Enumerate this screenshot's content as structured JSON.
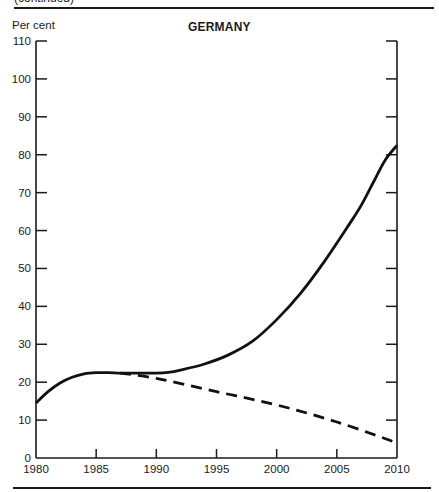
{
  "header": {
    "continued_label": "(continued)"
  },
  "chart_data": {
    "type": "line",
    "title": "GERMANY",
    "xlabel": "",
    "ylabel": "Per cent",
    "xlim": [
      1980,
      2010
    ],
    "ylim": [
      0,
      110
    ],
    "x_ticks": [
      1980,
      1985,
      1990,
      1995,
      2000,
      2005,
      2010
    ],
    "y_ticks": [
      0,
      10,
      20,
      30,
      40,
      50,
      60,
      70,
      80,
      90,
      100,
      110
    ],
    "grid": false,
    "legend": null,
    "series": [
      {
        "name": "solid line",
        "style": "solid",
        "x": [
          1980,
          1981,
          1982,
          1983,
          1984,
          1985,
          1986,
          1987,
          1988,
          1990,
          1991,
          1992,
          1994,
          1996,
          1998,
          2000,
          2002,
          2004,
          2006,
          2007,
          2008,
          2009,
          2010
        ],
        "y": [
          14.5,
          17.5,
          19.8,
          21.3,
          22.2,
          22.5,
          22.5,
          22.4,
          22.4,
          22.4,
          22.6,
          23.2,
          24.8,
          27.2,
          30.8,
          36.5,
          43.5,
          52.0,
          61.5,
          66.5,
          72.5,
          78.5,
          82.5
        ]
      },
      {
        "name": "dashed line",
        "style": "dashed",
        "x": [
          1987,
          1990,
          1995,
          2000,
          2005,
          2010
        ],
        "y": [
          22.4,
          21.0,
          17.5,
          14.0,
          9.5,
          4.0
        ]
      }
    ]
  }
}
